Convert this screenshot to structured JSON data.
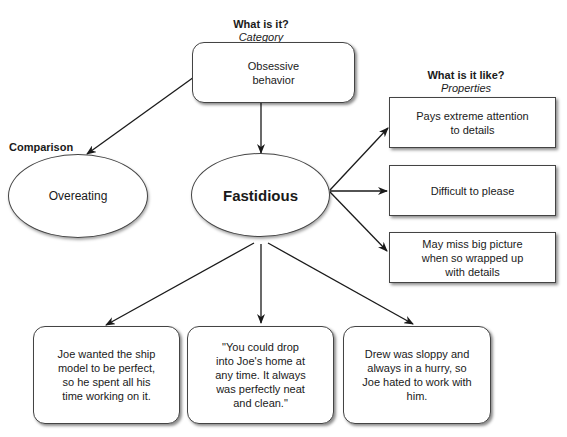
{
  "category": {
    "header": "What is it?",
    "subheader": "Category",
    "text": "Obsessive behavior"
  },
  "properties": {
    "header": "What is it like?",
    "subheader": "Properties",
    "items": [
      "Pays extreme attention to details",
      "Difficult to please",
      "May miss big picture when so wrapped up with details"
    ]
  },
  "comparison": {
    "header": "Comparison",
    "text": "Overeating"
  },
  "center": {
    "text": "Fastidious"
  },
  "examples": [
    "Joe wanted the ship model to be perfect, so he spent all his time working on it.",
    "\"You could drop into Joe's home at any time. It always was perfectly neat and clean.\"",
    "Drew was sloppy and always in a hurry, so Joe hated to work with him."
  ]
}
